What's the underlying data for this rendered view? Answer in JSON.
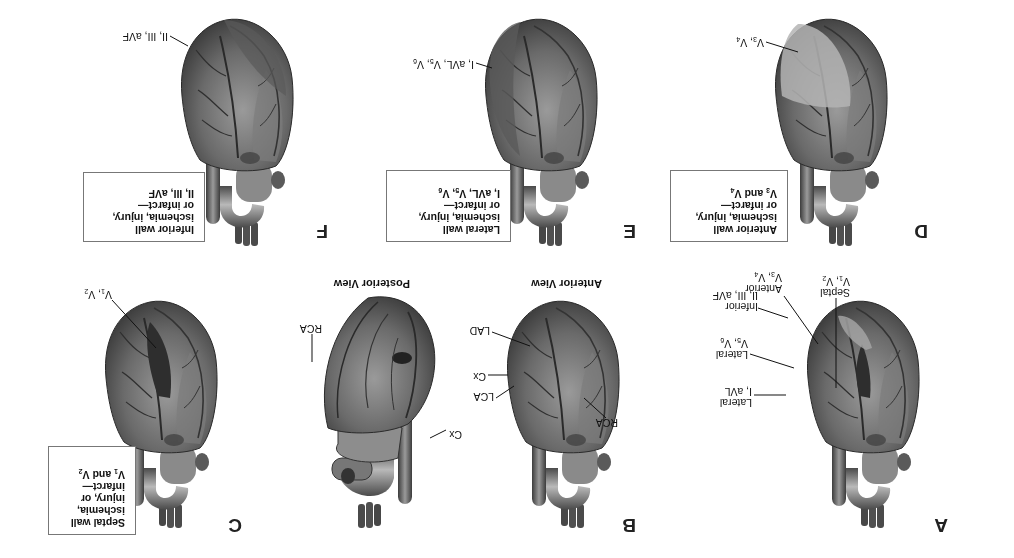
{
  "figure": {
    "orientation": "rotated 180 degrees",
    "panels": [
      {
        "id": "A",
        "letter": "A",
        "heart_view": "anterior",
        "highlight": "septal",
        "labels": [
          {
            "name": "Inferior",
            "leads": "II, III, aVF"
          },
          {
            "name": "Septal",
            "leads_base": "V",
            "leads": "V1, V2",
            "l1": "1",
            "l2": "2"
          },
          {
            "name": "Anterior",
            "leads": "V3, V4",
            "l1": "3",
            "l2": "4"
          },
          {
            "name": "Lateral",
            "leads": "V5, V6",
            "l1": "5",
            "l2": "6"
          },
          {
            "name": "Lateral",
            "leads": "I, aVL"
          }
        ]
      },
      {
        "id": "B",
        "letter": "B",
        "title": "Anterior View",
        "labels": [
          "LAD",
          "Cx",
          "LCA",
          "RCA"
        ]
      },
      {
        "id": "posterior",
        "title": "Posterior View",
        "labels": [
          "RCA",
          "Cx"
        ]
      },
      {
        "id": "C",
        "letter": "C",
        "lead_label": "V1, V2",
        "box": {
          "lines": [
            "Septal wall",
            "ischemia,",
            "injury, or",
            "infarct—",
            "V1 and V2"
          ]
        }
      },
      {
        "id": "D",
        "letter": "D",
        "lead_label": "V3, V4",
        "box": {
          "lines": [
            "Anterior wall",
            "ischemia, injury,",
            "or infarct—",
            "V3 and V4"
          ]
        }
      },
      {
        "id": "E",
        "letter": "E",
        "lead_label": "I, aVL, V5, V6",
        "box": {
          "lines": [
            "Lateral wall",
            "ischemia, injury,",
            "or infarct—",
            "I, aVL, V5, V6"
          ]
        }
      },
      {
        "id": "F",
        "letter": "F",
        "lead_label": "II, III, aVF",
        "box": {
          "lines": [
            "Inferior wall",
            "ischemia, injury,",
            "or infarct—",
            "II, III, aVF"
          ]
        }
      }
    ],
    "text": {
      "A_inferior": "Inferior",
      "A_inferior_leads": "II, III, aVF",
      "A_septal": "Septal",
      "A_anterior": "Anterior",
      "A_lateral1": "Lateral",
      "A_lateral2": "Lateral",
      "A_lateral2_leads": "I, aVL",
      "B_title": "Anterior View",
      "B_LAD": "LAD",
      "B_Cx": "Cx",
      "B_LCA": "LCA",
      "B_RCA": "RCA",
      "P_title": "Posterior View",
      "P_RCA": "RCA",
      "P_Cx": "Cx",
      "F_lead": "II, III, aVF",
      "V": "V",
      "and": "and",
      "comma": ", ",
      "I_aVL": "I, aVL, ",
      "C_box_1": "Septal wall",
      "C_box_2": "ischemia,",
      "C_box_3": "injury, or",
      "C_box_4": "infarct—",
      "D_box_1": "Anterior wall",
      "D_box_2": "ischemia, injury,",
      "D_box_3": "or infarct—",
      "E_box_1": "Lateral wall",
      "E_box_2": "ischemia, injury,",
      "E_box_3": "or infarct—",
      "F_box_1": "Inferior wall",
      "F_box_2": "ischemia, injury,",
      "F_box_3": "or infarct—",
      "F_box_4": "II, III, aVF"
    },
    "colors": {
      "heart_dark": "#3a3a3a",
      "heart_mid": "#6e6e6e",
      "heart_light": "#a8a8a8",
      "highlight_light": "#c4c4c4",
      "highlight_dark": "#2e2e2e",
      "box_border": "#777777"
    }
  }
}
